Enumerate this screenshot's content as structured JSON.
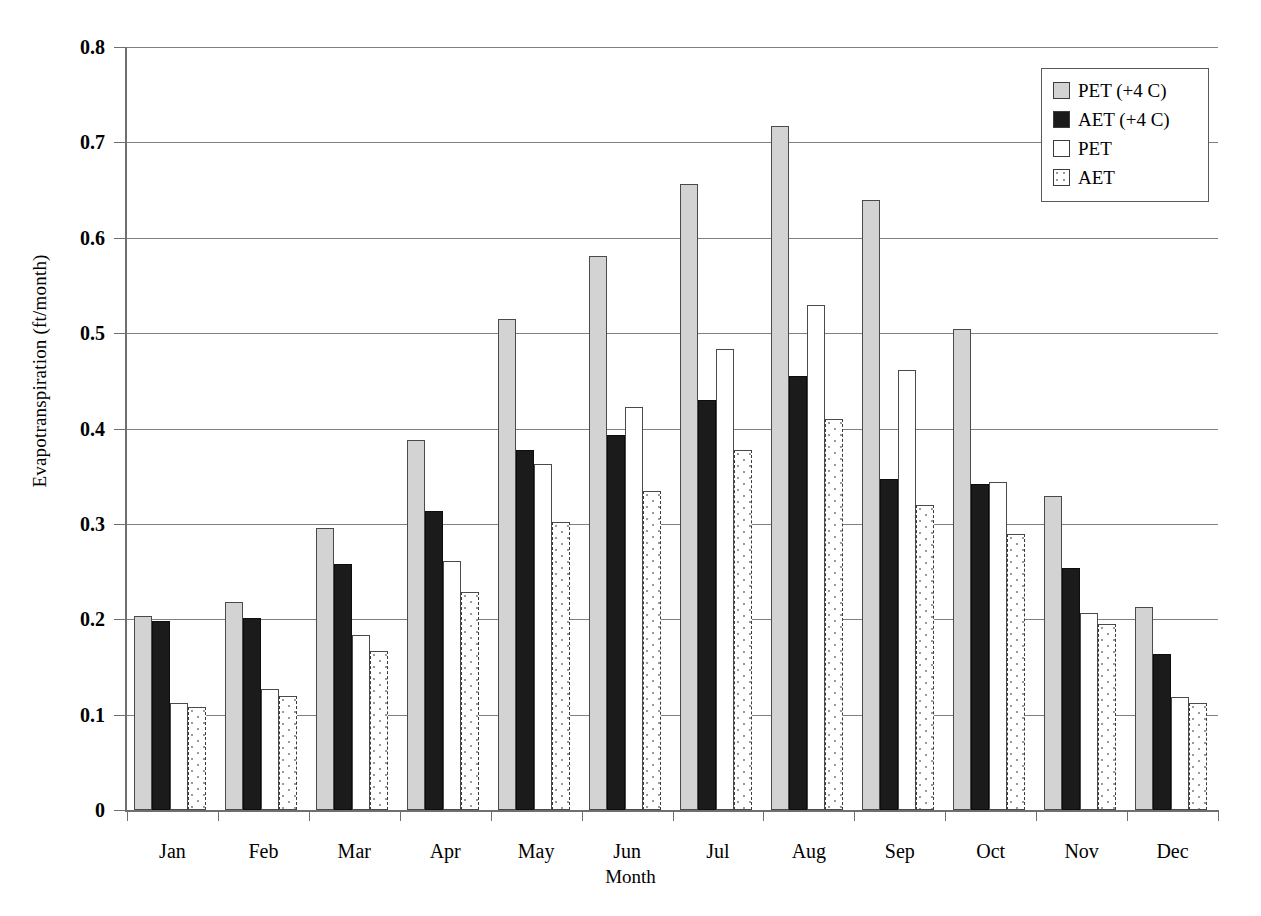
{
  "chart_data": {
    "type": "bar",
    "title": "",
    "xlabel": "Month",
    "ylabel": "Evapotranspiration (ft/month)",
    "categories": [
      "Jan",
      "Feb",
      "Mar",
      "Apr",
      "May",
      "Jun",
      "Jul",
      "Aug",
      "Sep",
      "Oct",
      "Nov",
      "Dec"
    ],
    "ylim": [
      0,
      0.8
    ],
    "ytick_labels": [
      "0",
      "0.1",
      "0.2",
      "0.3",
      "0.4",
      "0.5",
      "0.6",
      "0.7",
      "0.8"
    ],
    "ytick_values": [
      0,
      0.1,
      0.2,
      0.3,
      0.4,
      0.5,
      0.6,
      0.7,
      0.8
    ],
    "grid": true,
    "legend_position": "top-right",
    "series": [
      {
        "name": "PET (+4 C)",
        "swatch": "light-gray-filled",
        "color": "#d3d3d3",
        "values": [
          0.203,
          0.218,
          0.296,
          0.388,
          0.515,
          0.581,
          0.656,
          0.717,
          0.64,
          0.504,
          0.329,
          0.213
        ]
      },
      {
        "name": "AET (+4 C)",
        "swatch": "black-filled",
        "color": "#1b1b1b",
        "values": [
          0.198,
          0.201,
          0.258,
          0.314,
          0.377,
          0.393,
          0.43,
          0.455,
          0.347,
          0.342,
          0.254,
          0.164
        ]
      },
      {
        "name": "PET",
        "swatch": "white-outline",
        "color": "#ffffff",
        "values": [
          0.112,
          0.127,
          0.184,
          0.261,
          0.363,
          0.423,
          0.483,
          0.53,
          0.461,
          0.344,
          0.207,
          0.119
        ]
      },
      {
        "name": "AET",
        "swatch": "white-dotted",
        "color": "#ffffff",
        "values": [
          0.108,
          0.12,
          0.167,
          0.229,
          0.302,
          0.334,
          0.377,
          0.41,
          0.32,
          0.289,
          0.195,
          0.112
        ]
      }
    ]
  }
}
